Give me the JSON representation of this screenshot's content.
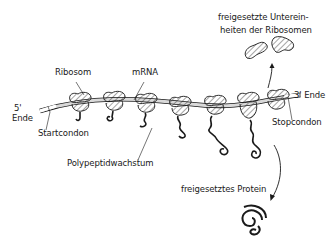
{
  "diagram": {
    "title": "",
    "labels": {
      "released_subunits_line1": "freigesetzte Unterein-",
      "released_subunits_line2": "heiten der Ribosomen",
      "ribosome": "Ribosom",
      "mrna": "mRNA",
      "five_prime": "5'",
      "five_prime_end": "Ende",
      "three_prime_end": "3' Ende",
      "stop_codon": "Stopcondon",
      "start_codon": "Startcondon",
      "polypeptide_growth": "Polypeptidwachstum",
      "released_protein": "freigesetztes Protein"
    },
    "components": {
      "mrna_strand": "mRNA strand from 5' end to 3' end",
      "ribosome_count": 7,
      "released_subunits": 2,
      "released_protein_count": 1
    },
    "colors": {
      "line": "#1a1a1a",
      "strand_fill": "#d9d9d9",
      "background": "#ffffff"
    }
  }
}
